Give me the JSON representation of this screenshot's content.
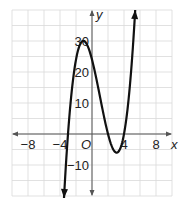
{
  "chart_data": {
    "type": "line",
    "title": "",
    "xlabel": "x",
    "ylabel": "y",
    "xlim": [
      -10,
      10
    ],
    "ylim": [
      -20,
      40
    ],
    "grid": true,
    "grid_step": {
      "x": 2,
      "y": 5
    },
    "x_ticks": [
      {
        "value": -8,
        "label": "−8"
      },
      {
        "value": -4,
        "label": "−4"
      },
      {
        "value": 4,
        "label": "4"
      },
      {
        "value": 8,
        "label": "8"
      }
    ],
    "y_ticks": [
      {
        "value": 30,
        "label": "30"
      },
      {
        "value": 20,
        "label": "20"
      },
      {
        "value": 10,
        "label": "10"
      },
      {
        "value": -10,
        "label": "−10"
      }
    ],
    "origin_label": "O",
    "series": [
      {
        "name": "f(x) = (x+3)(x-2)(x-4)",
        "roots": [
          -3,
          2,
          4
        ],
        "local_max": {
          "x": -1.08,
          "y": 30.0
        },
        "local_min": {
          "x": 3.08,
          "y": -6.0
        },
        "y_intercept": 24,
        "domain_shown": [
          -3.5,
          5.4
        ],
        "arrows": "both ends",
        "color": "#111111"
      }
    ]
  }
}
